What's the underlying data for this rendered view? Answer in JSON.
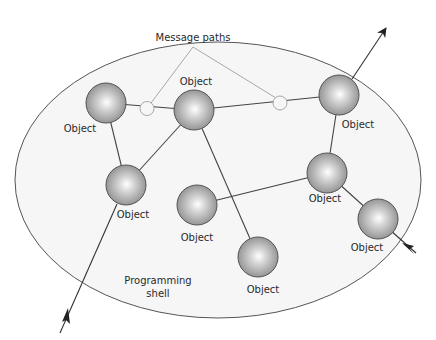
{
  "diagram": {
    "shell": {
      "label_line1": "Programming",
      "label_line2": "shell",
      "cx": 218,
      "cy": 180,
      "rx": 203,
      "ry": 138
    },
    "message_paths": {
      "label": "Message paths"
    },
    "objects": [
      {
        "id": "A",
        "label": "Object",
        "cx": 106,
        "cy": 103
      },
      {
        "id": "B",
        "label": "Object",
        "cx": 194,
        "cy": 110
      },
      {
        "id": "C",
        "label": "Object",
        "cx": 339,
        "cy": 95
      },
      {
        "id": "D",
        "label": "Object",
        "cx": 126,
        "cy": 185
      },
      {
        "id": "E",
        "label": "Object",
        "cx": 327,
        "cy": 173
      },
      {
        "id": "F",
        "label": "Object",
        "cx": 197,
        "cy": 205
      },
      {
        "id": "G",
        "label": "Object",
        "cx": 378,
        "cy": 219
      },
      {
        "id": "H",
        "label": "Object",
        "cx": 258,
        "cy": 257
      }
    ],
    "colors": {
      "line": "#444444",
      "message_line": "#a8a8a8",
      "shell_fill": "#f6f6f6",
      "sphere_dark": "#8e8e8e",
      "sphere_light": "#ffffff"
    }
  }
}
